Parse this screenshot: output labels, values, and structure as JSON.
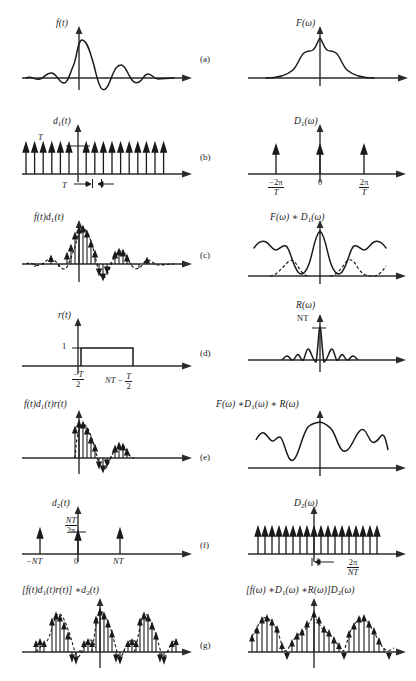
{
  "figure": {
    "caption": "",
    "rows": [
      {
        "tag": "(a)",
        "left_label": "f(t)",
        "right_label": "F(ω)",
        "left_type": "continuous-signal",
        "right_type": "spectrum"
      },
      {
        "tag": "(b)",
        "left_label": "d₁(t)",
        "right_label": "D₁(ω)",
        "left_type": "impulse-train",
        "right_type": "impulse-train",
        "left_amp_label": "T",
        "left_spacing_label": "T",
        "right_ticks": [
          {
            "num": "−2π",
            "den": "T"
          },
          {
            "num": "0",
            "den": ""
          },
          {
            "num": "2π",
            "den": "T"
          }
        ]
      },
      {
        "tag": "(c)",
        "left_label": "f(t)d₁(t)",
        "right_label": "F(ω) ∗ D₁(ω)",
        "left_type": "sampled-signal",
        "right_type": "periodic-spectrum"
      },
      {
        "tag": "(d)",
        "left_label": "r(t)",
        "right_label": "R(ω)",
        "left_type": "rect-window",
        "right_type": "sinc",
        "left_amp_label": "1",
        "right_amp_label": "NT",
        "left_tick_start": {
          "num": "−T",
          "den": "2"
        },
        "left_tick_end": "NT − T/2"
      },
      {
        "tag": "(e)",
        "left_label": "f(t)d₁(t)r(t)",
        "right_label": "F(ω) ∗D₁(ω) ∗ R(ω)",
        "left_type": "windowed-samples",
        "right_type": "smeared-spectrum"
      },
      {
        "tag": "(f)",
        "left_label": "d₂(t)",
        "right_label": "D₂(ω)",
        "left_type": "sparse-impulse-train",
        "right_type": "impulse-train",
        "left_amp": {
          "num": "NT",
          "den": "2π"
        },
        "left_ticks": [
          "−NT",
          "0",
          "NT"
        ],
        "right_spacing": {
          "num": "2π",
          "den": "NT"
        }
      },
      {
        "tag": "(g)",
        "left_label": "[f(t)d₁(t)r(t)] ∗d₂(t)",
        "right_label": "[f(ω) ∗D₁(ω) ∗R(ω)]D₂(ω)",
        "left_type": "periodic-sampled-signal",
        "right_type": "periodic-sampled-spectrum"
      }
    ]
  },
  "style": {
    "stroke": "#1a1a1a",
    "axis": "#2b2b2b",
    "dashed": "#1a1a1a",
    "background": "#ffffff"
  }
}
